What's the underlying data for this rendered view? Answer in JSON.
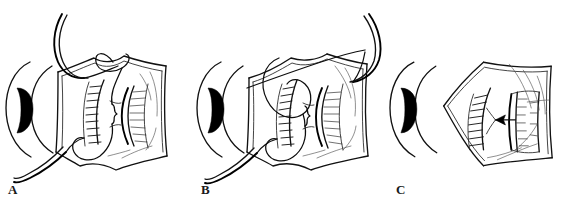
{
  "figure": {
    "type": "line-drawing",
    "background_color": "#ffffff",
    "ink_color": "#111111",
    "panel_count": 3,
    "caption": ""
  },
  "panels": [
    {
      "id": "A",
      "label": "A",
      "stage_description": "Curved needle with suture passed through upper flap edge; free suture tails exiting above and below the globe",
      "features": [
        "eye-globe-arcs",
        "dark-pupil-crescent",
        "tissue-flap-outline",
        "hatched-comb-margin-left",
        "hatched-comb-margin-right",
        "central-suture-knot",
        "curved-needle-upper",
        "suture-tail-lower"
      ],
      "has_needle": true,
      "has_arrow": false
    },
    {
      "id": "B",
      "label": "B",
      "stage_description": "Suture loop drawn across the flap, needle re-entering at the upper right; flap partially rotated",
      "features": [
        "eye-globe-arcs",
        "dark-pupil-crescent",
        "tissue-flap-outline",
        "hatched-comb-margin-left",
        "hatched-comb-margin-right",
        "central-suture-knot",
        "suture-loop-crossing",
        "curved-needle-upper-right",
        "suture-tail-lower"
      ],
      "has_needle": true,
      "has_arrow": false
    },
    {
      "id": "C",
      "label": "C",
      "stage_description": "Completed closure: flap seated with the margins apposed; arrow indicates direction of advancement",
      "features": [
        "eye-globe-arcs",
        "dark-pupil-crescent",
        "tissue-flap-outline-closed",
        "hatched-comb-margin-left",
        "apposed-margin-right",
        "direction-arrow-left"
      ],
      "has_needle": false,
      "has_arrow": true,
      "arrow_direction": "left"
    }
  ],
  "colors": {
    "ink": "#111111",
    "ink_light": "#444444",
    "pupil": "#000000",
    "paper": "#ffffff"
  }
}
